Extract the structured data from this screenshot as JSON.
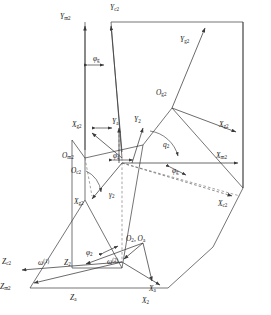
{
  "figure": {
    "type": "engineering-kinematic-diagram",
    "stroke_color": "#3a3a3a",
    "dashed_color": "#6a6a6a",
    "background": "#ffffff"
  },
  "axis_labels": [
    {
      "id": "Y_m2",
      "base": "Y",
      "sub": "m2",
      "x": 66,
      "y": 16
    },
    {
      "id": "Y_c2",
      "base": "Y",
      "sub": "c2",
      "x": 116,
      "y": 7
    },
    {
      "id": "Y_g2",
      "base": "Y",
      "sub": "g2",
      "x": 186,
      "y": 39
    },
    {
      "id": "X_g2L",
      "base": "X",
      "sub": "g2",
      "x": 80,
      "y": 124
    },
    {
      "id": "Y_a",
      "base": "Y",
      "sub": "a",
      "x": 118,
      "y": 121
    },
    {
      "id": "Y_2",
      "base": "Y",
      "sub": "2",
      "x": 139,
      "y": 119
    },
    {
      "id": "O_g2",
      "base": "O",
      "sub": "g2",
      "x": 162,
      "y": 92
    },
    {
      "id": "X_g2R",
      "base": "X",
      "sub": "g2",
      "x": 225,
      "y": 124
    },
    {
      "id": "X_m2",
      "base": "X",
      "sub": "m2",
      "x": 222,
      "y": 155
    },
    {
      "id": "X_c2",
      "base": "X",
      "sub": "c2",
      "x": 224,
      "y": 203
    },
    {
      "id": "O_m2",
      "base": "O",
      "sub": "m2",
      "x": 68,
      "y": 155
    },
    {
      "id": "O_c2",
      "base": "O",
      "sub": "c2",
      "x": 77,
      "y": 170
    },
    {
      "id": "X_g2B",
      "base": "X",
      "sub": "g2",
      "x": 80,
      "y": 201
    },
    {
      "id": "O_2Oa",
      "base": "O",
      "sub": "2",
      "x": 132,
      "y": 238
    },
    {
      "id": "Z_c2",
      "base": "Z",
      "sub": "c2",
      "x": 6,
      "y": 261
    },
    {
      "id": "Z_2",
      "base": "Z",
      "sub": "2",
      "x": 70,
      "y": 262
    },
    {
      "id": "Z_m2",
      "base": "Z",
      "sub": "m2",
      "x": 3,
      "y": 286
    },
    {
      "id": "Z_a",
      "base": "Z",
      "sub": "a",
      "x": 75,
      "y": 297
    },
    {
      "id": "X_a",
      "base": "X",
      "sub": "a",
      "x": 155,
      "y": 288
    },
    {
      "id": "X_2",
      "base": "X",
      "sub": "2",
      "x": 148,
      "y": 300
    }
  ],
  "angle_labels": [
    {
      "id": "phi_g_top",
      "base": "φ",
      "sub": "g",
      "x": 99,
      "y": 58
    },
    {
      "id": "q_2",
      "base": "q",
      "sub": "2",
      "x": 168,
      "y": 144
    },
    {
      "id": "phi_a_origin",
      "base": "φ",
      "sub": "a",
      "x": 117,
      "y": 156
    },
    {
      "id": "phi_g_mid",
      "base": "φ",
      "sub": "g",
      "x": 178,
      "y": 170
    },
    {
      "id": "gamma_2",
      "base": "γ",
      "sub": "2",
      "x": 114,
      "y": 194
    },
    {
      "id": "phi_2",
      "base": "φ",
      "sub": "2",
      "x": 91,
      "y": 252
    }
  ],
  "omega_labels": [
    {
      "id": "omega_1",
      "base": "ω",
      "sup": "(1)",
      "x": 44,
      "y": 262
    },
    {
      "id": "omega_2",
      "base": "ω",
      "sup": "(2)",
      "x": 113,
      "y": 261
    }
  ],
  "origin_pair_suffix": ", O",
  "origin_pair_sub": "a"
}
